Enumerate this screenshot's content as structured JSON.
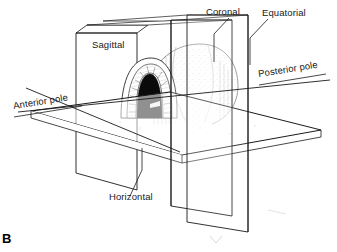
{
  "figure": {
    "panel_letter": "B",
    "ink_color": "#1a1a1a",
    "background_color": "#ffffff"
  },
  "labels": {
    "sagittal": "Sagittal",
    "coronal": "Coronal",
    "equatorial": "Equatorial",
    "horizontal": "Horizontal",
    "anterior_pole": "Anterior pole",
    "posterior_pole": "Posterior pole"
  },
  "planes": [
    {
      "name": "sagittal",
      "label": "Sagittal",
      "orientation": "vertical-longitudinal"
    },
    {
      "name": "coronal",
      "label": "Coronal",
      "orientation": "vertical-transverse"
    },
    {
      "name": "equatorial",
      "label": "Equatorial",
      "orientation": "vertical-transverse"
    },
    {
      "name": "horizontal",
      "label": "Horizontal",
      "orientation": "horizontal"
    }
  ],
  "axis": {
    "name": "anteroposterior-axis",
    "start_label": "Anterior pole",
    "end_label": "Posterior pole"
  },
  "structures": [
    {
      "name": "cornea",
      "label": ""
    },
    {
      "name": "iris",
      "label": ""
    },
    {
      "name": "pupil",
      "label": ""
    },
    {
      "name": "sclera-globe",
      "label": ""
    }
  ]
}
